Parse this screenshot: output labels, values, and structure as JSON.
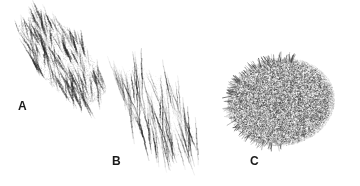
{
  "figure": {
    "width": 360,
    "height": 186,
    "background_color": "#ffffff",
    "ink_color": "#2b2b2b",
    "label_color": "#1a1a1a"
  },
  "samples": [
    {
      "id": "sample-a",
      "label": "A",
      "label_x": 18,
      "label_y": 100,
      "technique": "zigzag-hatching",
      "description": "Dense diagonal back-and-forth zigzag pencil scribble forming an elongated band running from upper-left to lower-right",
      "band": {
        "start_x": 28,
        "start_y": 18,
        "end_x": 96,
        "end_y": 100,
        "half_width": 26,
        "angle_deg": 50
      },
      "stroke": {
        "count": 130,
        "min_width": 0.7,
        "max_width": 2.1,
        "min_opacity": 0.18,
        "max_opacity": 0.85,
        "length_min": 14,
        "length_max": 30,
        "angle_deg": 72,
        "angle_jitter_deg": 16
      },
      "grain": {
        "dots": 2600,
        "max_opacity": 0.3,
        "radius": 0.45
      }
    },
    {
      "id": "sample-b",
      "label": "B",
      "label_x": 112,
      "label_y": 155,
      "technique": "tapered-parallel-strokes",
      "description": "Long thin tapering near-vertical pencil strokes, loosely spaced, sweeping from upper-left down to lower-right with visible white gaps",
      "band": {
        "start_x": 126,
        "start_y": 72,
        "end_x": 186,
        "end_y": 150,
        "half_width": 26,
        "angle_deg": 52
      },
      "stroke": {
        "count": 86,
        "min_width": 0.5,
        "max_width": 1.5,
        "min_opacity": 0.22,
        "max_opacity": 0.9,
        "length_min": 26,
        "length_max": 56,
        "angle_deg": 78,
        "angle_jitter_deg": 13
      },
      "grain": {
        "dots": 900,
        "max_opacity": 0.2,
        "radius": 0.4
      }
    },
    {
      "id": "sample-c",
      "label": "C",
      "label_x": 250,
      "label_y": 155,
      "technique": "fine-dense-stipple",
      "description": "Rounded blob of very fine, uniformly dense graphite stipple with soft feathered edges and short spiky ticks along the lower-left rim",
      "blob": {
        "center_x": 281,
        "center_y": 102,
        "radius_x": 54,
        "radius_y": 44,
        "rotation_deg": -8
      },
      "stipple": {
        "dots": 26000,
        "min_opacity": 0.06,
        "max_opacity": 0.55,
        "radius_min": 0.22,
        "radius_max": 0.6
      },
      "rim_ticks": {
        "count": 150,
        "length_min": 3,
        "length_max": 9,
        "width": 0.8,
        "max_opacity": 0.8,
        "arc_start_deg": 95,
        "arc_end_deg": 290
      }
    }
  ]
}
